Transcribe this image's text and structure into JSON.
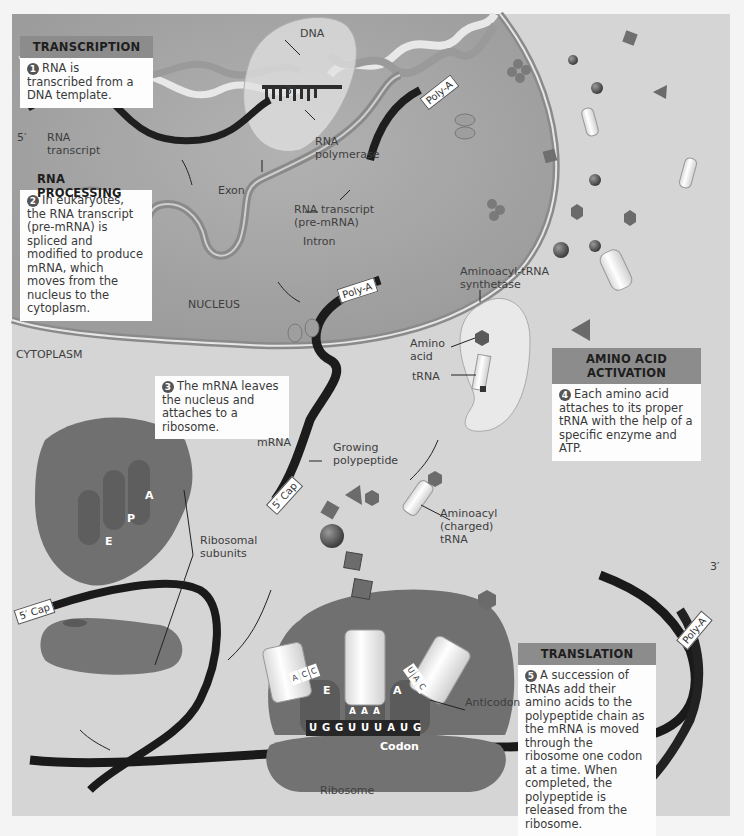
{
  "figure": {
    "regions": {
      "nucleus": "NUCLEUS",
      "cytoplasm": "CYTOPLASM"
    },
    "steps": [
      {
        "number": "1",
        "title": "TRANSCRIPTION",
        "text": "RNA is transcribed from a DNA template."
      },
      {
        "number": "2",
        "title": "RNA PROCESSING",
        "text": "In eukaryotes, the RNA transcript (pre-mRNA) is spliced and modified to produce mRNA, which moves from the nucleus to the cytoplasm."
      },
      {
        "number": "3",
        "title": "",
        "text": "The mRNA leaves the nucleus and attaches to a ribosome."
      },
      {
        "number": "4",
        "title": "AMINO ACID ACTIVATION",
        "text": "Each amino acid attaches to its proper tRNA with the help of a specific enzyme and ATP."
      },
      {
        "number": "5",
        "title": "TRANSLATION",
        "text": "A succession of tRNAs add their amino acids to the polypeptide chain as the mRNA is moved through the ribosome one codon at a time. When completed, the polypeptide is released from the ribosome."
      }
    ],
    "labels": {
      "dna": "DNA",
      "three_prime_top": "3′",
      "five_prime_left": "5′",
      "rna_transcript": "RNA\ntranscript",
      "rna_polymerase": "RNA\npolymerase",
      "exon": "Exon",
      "rna_transcript_pre": "RNA transcript\n(pre-mRNA)",
      "intron": "Intron",
      "poly_a": "Poly-A",
      "five_cap": "5′ Cap",
      "mrna": "mRNA",
      "aminoacyl_trna_synthetase": "Aminoacyl-tRNA\nsynthetase",
      "amino_acid": "Amino\nacid",
      "trna": "tRNA",
      "growing_polypeptide": "Growing\npolypeptide",
      "aminoacyl_charged_trna": "Aminoacyl\n(charged)\ntRNA",
      "ribosomal_subunits": "Ribosomal\nsubunits",
      "anticodon": "Anticodon",
      "codon": "Codon",
      "ribosome": "Ribosome",
      "three_prime_right": "3′",
      "site_e": "E",
      "site_p": "P",
      "site_a": "A"
    },
    "mrna_sequence": [
      "U",
      "G",
      "G",
      "U",
      "U",
      "U",
      "A",
      "U",
      "G"
    ],
    "anticodons": {
      "e_site": [
        "A",
        "C",
        "C"
      ],
      "p_site": [
        "A",
        "A",
        "A"
      ],
      "a_site": [
        "U",
        "A",
        "C"
      ]
    }
  },
  "colors": {
    "background": "#d5d5d5",
    "nucleus": "#a9a9a9",
    "ribosome": "#6c6c6c",
    "header_bar": "#8c8c8c",
    "ribbon": "#1c1c1c"
  }
}
